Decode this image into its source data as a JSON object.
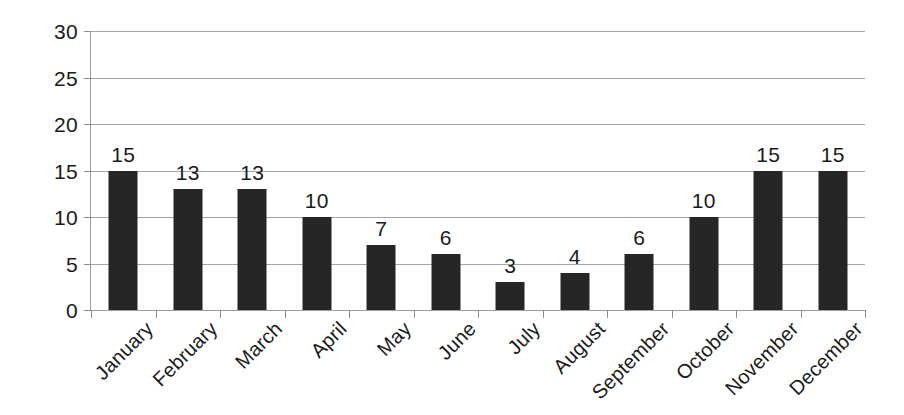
{
  "chart_data": {
    "type": "bar",
    "title": "",
    "subtitle": "",
    "xlabel": "",
    "ylabel": "",
    "categories": [
      "January",
      "February",
      "March",
      "April",
      "May",
      "June",
      "July",
      "August",
      "September",
      "October",
      "November",
      "December"
    ],
    "values": [
      15,
      13,
      13,
      10,
      7,
      6,
      3,
      4,
      6,
      10,
      15,
      15
    ],
    "data_labels": [
      "15",
      "13",
      "13",
      "10",
      "7",
      "6",
      "3",
      "4",
      "6",
      "10",
      "15",
      "15"
    ],
    "ylim": [
      0,
      30
    ],
    "ytick_values": [
      30,
      25,
      20,
      15,
      10,
      5,
      0
    ],
    "ytick_labels": [
      "30",
      "25",
      "20",
      "15",
      "10",
      "5",
      "0"
    ],
    "ytick_step": 5,
    "grid": true,
    "grid_axis": "y",
    "legend": false,
    "legend_position": "none",
    "show_data_labels": true,
    "xtick_label_rotation": -45,
    "series": [
      {
        "name": "",
        "values": [
          15,
          13,
          13,
          10,
          7,
          6,
          3,
          4,
          6,
          10,
          15,
          15
        ]
      }
    ]
  },
  "colors": {
    "bar_fill": "#262626",
    "gridline": "#a6a6a6",
    "axis_line": "#9c9c9c",
    "tick_mark": "#8c8c8c",
    "text": "#1a1a1a",
    "background": "#ffffff"
  }
}
